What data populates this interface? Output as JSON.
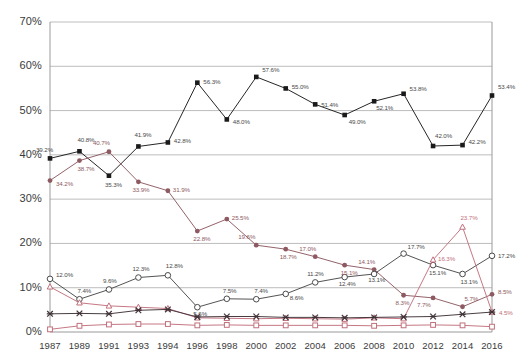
{
  "chart_data": {
    "type": "line",
    "title": "",
    "xlabel": "",
    "ylabel": "",
    "ylim": [
      0,
      70
    ],
    "ytick_labels": [
      "0%",
      "10%",
      "20%",
      "30%",
      "40%",
      "50%",
      "60%",
      "70%"
    ],
    "ytick_values": [
      0,
      10,
      20,
      30,
      40,
      50,
      60,
      70
    ],
    "grid": true,
    "legend": "none",
    "categories": [
      "1987",
      "1989",
      "1991",
      "1993",
      "1994",
      "1996",
      "1998",
      "2000",
      "2002",
      "2004",
      "2006",
      "2008",
      "2010",
      "2012",
      "2014",
      "2016"
    ],
    "series": [
      {
        "name": "black-square-series",
        "color": "#1a1a1a",
        "marker": "filled-square",
        "values": [
          39.2,
          40.8,
          35.3,
          41.9,
          42.8,
          56.3,
          48.0,
          57.6,
          55.0,
          51.4,
          49.0,
          52.1,
          53.8,
          42.0,
          42.2,
          53.4
        ],
        "labels": [
          "39.2%",
          "40.8%",
          "35.3%",
          "41.9%",
          "42.8%",
          "56.3%",
          "48.0%",
          "57.6%",
          "55.0%",
          "51.4%",
          "49.0%",
          "52.1%",
          "53.8%",
          "42.0%",
          "42.2%",
          "53.4%"
        ]
      },
      {
        "name": "maroon-circle-series",
        "color": "#8e5a62",
        "marker": "filled-circle",
        "values": [
          34.2,
          38.7,
          40.7,
          33.9,
          31.9,
          22.8,
          25.5,
          19.6,
          18.7,
          17.0,
          15.1,
          14.1,
          8.3,
          7.7,
          5.7,
          8.5
        ],
        "labels": [
          "34.2%",
          "38.7%",
          "40.7%",
          "33.9%",
          "31.9%",
          "22.8%",
          "25.5%",
          "19.6%",
          "18.7%",
          "17.0%",
          "15.1%",
          "14.1%",
          "8.3%",
          "7.7%",
          "5.7%",
          "8.5%"
        ]
      },
      {
        "name": "open-circle-series",
        "color": "#4a4a4a",
        "marker": "open-circle",
        "values": [
          12.0,
          7.4,
          9.6,
          12.3,
          12.8,
          5.6,
          7.5,
          7.4,
          8.6,
          11.2,
          12.4,
          13.1,
          17.7,
          15.1,
          13.1,
          17.2
        ],
        "labels": [
          "12.0%",
          "7.4%",
          "9.6%",
          "12.3%",
          "12.8%",
          "5.6%",
          "7.5%",
          "7.4%",
          "8.6%",
          "11.2%",
          "12.4%",
          "13.1%",
          "17.7%",
          "15.1%",
          "13.1%",
          "17.2%"
        ]
      },
      {
        "name": "pink-triangle-series",
        "color": "#c2707c",
        "marker": "open-triangle",
        "values": [
          10.2,
          6.6,
          5.9,
          5.6,
          5.3,
          3.2,
          3.1,
          3.0,
          3.1,
          3.0,
          2.9,
          3.2,
          3.0,
          16.3,
          23.7,
          4.5
        ],
        "labels": [
          "",
          "",
          "",
          "",
          "",
          "",
          "",
          "",
          "",
          "",
          "",
          "",
          "",
          "16.3%",
          "23.7%",
          "4.5%"
        ]
      },
      {
        "name": "dark-x-series",
        "color": "#3f3338",
        "marker": "cross",
        "values": [
          4.1,
          4.2,
          4.1,
          4.9,
          5.1,
          3.4,
          3.5,
          3.5,
          3.3,
          3.3,
          3.2,
          3.3,
          3.4,
          3.5,
          4.0,
          4.5
        ],
        "labels": [
          "",
          "",
          "",
          "",
          "",
          "",
          "",
          "",
          "",
          "",
          "",
          "",
          "",
          "",
          "",
          ""
        ]
      },
      {
        "name": "pink-square-series",
        "color": "#c2707c",
        "marker": "open-square",
        "values": [
          0.6,
          1.4,
          1.7,
          1.8,
          1.8,
          1.5,
          1.6,
          1.5,
          1.5,
          1.5,
          1.5,
          1.4,
          1.5,
          1.6,
          1.5,
          1.2
        ],
        "labels": [
          "",
          "",
          "",
          "",
          "",
          "",
          "",
          "",
          "",
          "",
          "",
          "",
          "",
          "",
          "",
          ""
        ]
      }
    ]
  }
}
